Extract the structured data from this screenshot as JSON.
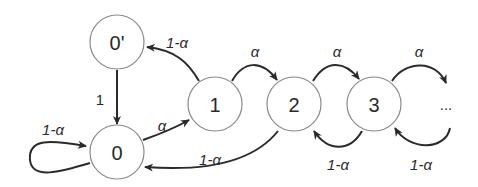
{
  "diagram": {
    "type": "state-transition",
    "nodes": [
      {
        "id": "0p",
        "label": "0'"
      },
      {
        "id": "0",
        "label": "0"
      },
      {
        "id": "1",
        "label": "1"
      },
      {
        "id": "2",
        "label": "2"
      },
      {
        "id": "3",
        "label": "3"
      }
    ],
    "ellipsis": "...",
    "edges": [
      {
        "from": "0",
        "to": "0",
        "label": "1-α"
      },
      {
        "from": "0p",
        "to": "0",
        "label": "1"
      },
      {
        "from": "0",
        "to": "1",
        "label": "α"
      },
      {
        "from": "1",
        "to": "0p",
        "label": "1-α"
      },
      {
        "from": "1",
        "to": "2",
        "label": "α"
      },
      {
        "from": "2",
        "to": "0",
        "label": "1-α"
      },
      {
        "from": "2",
        "to": "3",
        "label": "α"
      },
      {
        "from": "3",
        "to": "2",
        "label": "1-α"
      },
      {
        "from": "3",
        "to": "...",
        "label": "α"
      },
      {
        "from": "...",
        "to": "3",
        "label": "1-α"
      }
    ]
  }
}
